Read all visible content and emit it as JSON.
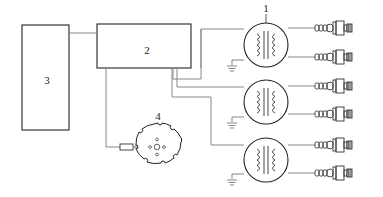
{
  "diagram": {
    "blocks": [
      {
        "id": "3",
        "label": "3"
      },
      {
        "id": "2",
        "label": "2"
      }
    ],
    "transformers": [
      {
        "id": "t1",
        "label": "1"
      },
      {
        "id": "t2",
        "label": ""
      },
      {
        "id": "t3",
        "label": ""
      }
    ],
    "rotor": {
      "label": "4"
    },
    "colors": {
      "line": "#333333",
      "wire": "#888888"
    }
  }
}
